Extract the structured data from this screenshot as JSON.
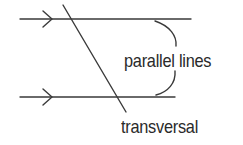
{
  "diagram": {
    "labels": {
      "parallel": "parallel lines",
      "transversal": "transversal"
    },
    "elements": {
      "top_line": {
        "x1": 20,
        "y1": 19,
        "x2": 191,
        "y2": 19,
        "arrow": "chevron-right"
      },
      "bottom_line": {
        "x1": 20,
        "y1": 97,
        "x2": 175,
        "y2": 97,
        "arrow": "chevron-right"
      },
      "transversal_line": {
        "x1": 63,
        "y1": 5,
        "x2": 126,
        "y2": 112
      },
      "bracket": "curved brace joining the two parallel lines on the right"
    },
    "colors": {
      "stroke": "#3a3a3a",
      "text": "#2a2a2a",
      "background": "#ffffff"
    }
  }
}
